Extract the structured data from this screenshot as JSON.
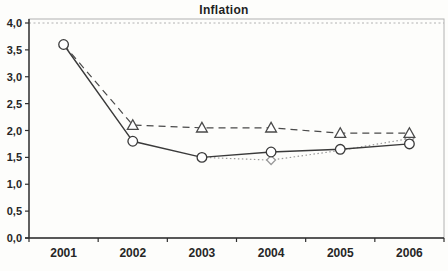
{
  "chart_data": {
    "type": "line",
    "title": "Inflation",
    "categories": [
      "2001",
      "2002",
      "2003",
      "2004",
      "2005",
      "2006"
    ],
    "series": [
      {
        "name": "dotted-diamond",
        "style": "dotted",
        "marker": "diamond",
        "color": "#9a9a9a",
        "values": [
          null,
          null,
          1.5,
          1.45,
          1.63,
          1.85
        ],
        "marker_visible": [
          false,
          false,
          false,
          true,
          false,
          true
        ]
      },
      {
        "name": "dashed-triangle",
        "style": "dashed",
        "marker": "triangle",
        "color": "#4a4a4a",
        "values": [
          3.6,
          2.1,
          2.05,
          2.05,
          1.95,
          1.95
        ],
        "marker_visible": [
          false,
          true,
          true,
          true,
          true,
          true
        ]
      },
      {
        "name": "solid-circle",
        "style": "solid",
        "marker": "circle",
        "color": "#3a3a3a",
        "values": [
          3.6,
          1.8,
          1.5,
          1.6,
          1.65,
          1.75
        ],
        "marker_visible": [
          true,
          true,
          true,
          true,
          true,
          true
        ]
      }
    ],
    "y_axis": {
      "min": 0,
      "max": 4,
      "step": 0.5,
      "tick_labels": [
        "0,0",
        "0,5",
        "1,0",
        "1,5",
        "2,0",
        "2,5",
        "3,0",
        "3,5",
        "4,0"
      ]
    },
    "x_axis": {
      "tick_labels": [
        "2001",
        "2002",
        "2003",
        "2004",
        "2005",
        "2006"
      ]
    },
    "grid": {
      "top_gridline_value": 4.0,
      "style": "dotted"
    },
    "legend": "none",
    "colors": {
      "frame": "#b2b2b2",
      "axis": "#2e2e2e",
      "background": "#fdfdfb",
      "marker_fill": "#ffffff"
    }
  }
}
